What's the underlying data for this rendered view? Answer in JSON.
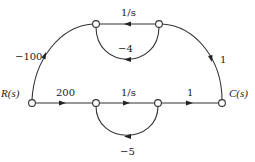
{
  "diagram": {
    "type": "signal-flow-graph",
    "nodes": [
      {
        "id": "R",
        "label": "R(s)",
        "x": 32,
        "y": 103
      },
      {
        "id": "n1",
        "label": "",
        "x": 96,
        "y": 103
      },
      {
        "id": "n2",
        "label": "",
        "x": 158,
        "y": 103
      },
      {
        "id": "C",
        "label": "C(s)",
        "x": 222,
        "y": 103
      },
      {
        "id": "t1",
        "label": "",
        "x": 96,
        "y": 24
      },
      {
        "id": "t2",
        "label": "",
        "x": 159,
        "y": 24
      }
    ],
    "edges": [
      {
        "from": "R",
        "to": "n1",
        "gain": "200"
      },
      {
        "from": "n1",
        "to": "n2",
        "gain": "1/s"
      },
      {
        "from": "n2",
        "to": "C",
        "gain": "1"
      },
      {
        "from": "n2",
        "to": "n1",
        "gain": "−5",
        "kind": "self-loop feedback"
      },
      {
        "from": "R",
        "to": "t1",
        "gain": "−100"
      },
      {
        "from": "t2",
        "to": "t1",
        "gain": "1/s"
      },
      {
        "from": "t1",
        "to": "t2",
        "gain": "−4",
        "kind": "loop feedback"
      },
      {
        "from": "t2",
        "to": "C",
        "gain": "1"
      }
    ]
  },
  "labels": {
    "input": "R(s)",
    "output": "C(s)",
    "gain_r_n1": "200",
    "gain_n1_n2": "1/s",
    "gain_n2_c": "1",
    "gain_bottom_loop": "−5",
    "gain_r_t1": "−100",
    "gain_top": "1/s",
    "gain_top_loop": "−4",
    "gain_t2_c": "1"
  }
}
